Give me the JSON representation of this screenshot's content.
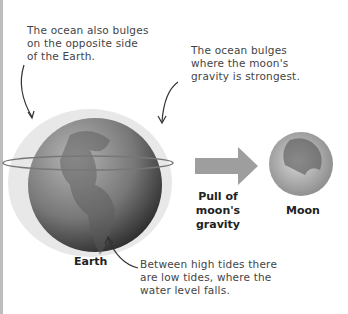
{
  "diagram": {
    "annotations": {
      "opposite_bulge": [
        "The ocean also bulges",
        "on the opposite side",
        "of the Earth."
      ],
      "near_bulge": [
        "The ocean bulges",
        "where the moon's",
        "gravity is strongest."
      ],
      "low_tides": [
        "Between high tides there",
        "are low tides, where the",
        "water level falls."
      ]
    },
    "labels": {
      "earth": "Earth",
      "pull": [
        "Pull of",
        "moon's",
        "gravity"
      ],
      "moon": "Moon"
    },
    "colors": {
      "arrow": "#9e9e9e",
      "bulge": "#e6e6e6",
      "earth_dark": "#333333",
      "earth_light": "#9a9a9a",
      "orbit_ring": "#777777"
    }
  }
}
